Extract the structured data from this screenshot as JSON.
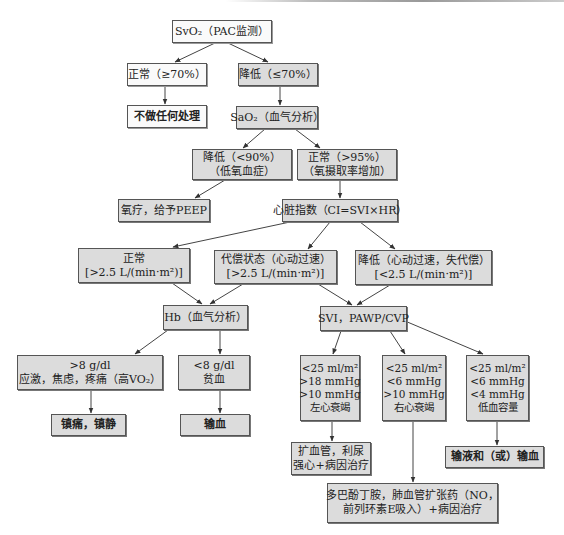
{
  "diagram": {
    "type": "flowchart",
    "nodes": {
      "svo2": {
        "lines": [
          "SvO₂（PAC监测）"
        ],
        "fill": "white"
      },
      "svo2_normal": {
        "lines": [
          "正常（≥70%）"
        ],
        "fill": "white"
      },
      "svo2_low": {
        "lines": [
          "降低（≤70%）"
        ],
        "fill": "gray"
      },
      "no_treatment": {
        "lines": [
          "不做任何处理"
        ],
        "fill": "white",
        "bold": true
      },
      "sao2": {
        "lines": [
          "SaO₂（血气分析）"
        ],
        "fill": "gray"
      },
      "sao2_low": {
        "lines": [
          "降低（<90%）",
          "（低氧血症）"
        ],
        "fill": "gray"
      },
      "sao2_normal": {
        "lines": [
          "正常（>95%）",
          "（氧摄取率增加）"
        ],
        "fill": "gray"
      },
      "oxygen_therapy": {
        "lines": [
          "氧疗，给予PEEP"
        ],
        "fill": "gray"
      },
      "cardiac_index": {
        "lines": [
          "心脏指数（CI=SVI×HR）"
        ],
        "fill": "gray"
      },
      "ci_normal": {
        "lines": [
          "正常",
          "[>2.5 L/(min·m²)]"
        ],
        "fill": "gray"
      },
      "ci_compensated": {
        "lines": [
          "代偿状态（心动过速）",
          "[>2.5 L/(min·m²)]"
        ],
        "fill": "gray"
      },
      "ci_low": {
        "lines": [
          "降低（心动过速，失代偿）",
          "[<2.5 L/(min·m²)]"
        ],
        "fill": "gray"
      },
      "hb": {
        "lines": [
          "Hb（血气分析）"
        ],
        "fill": "gray"
      },
      "svi": {
        "lines": [
          "SVI，PAWP/CVP"
        ],
        "fill": "gray"
      },
      "hb_high": {
        "lines": [
          ">8 g/dl",
          "应激，焦虑，疼痛（高VO₂）"
        ],
        "fill": "gray"
      },
      "hb_low": {
        "lines": [
          "<8 g/dl",
          "贫血"
        ],
        "fill": "gray"
      },
      "analgesia": {
        "lines": [
          "镇痛，镇静"
        ],
        "fill": "gray",
        "bold": true
      },
      "transfusion": {
        "lines": [
          "输血"
        ],
        "fill": "gray",
        "bold": true
      },
      "lv_failure": {
        "lines": [
          "<25 ml/m²",
          ">18 mmHg",
          ">10 mmHg",
          "左心衰竭"
        ],
        "fill": "gray"
      },
      "rv_failure": {
        "lines": [
          "<25 ml/m²",
          "<6 mmHg",
          ">10 mmHg",
          "右心衰竭"
        ],
        "fill": "gray"
      },
      "hypovolemia": {
        "lines": [
          "<25 ml/m²",
          "<6 mmHg",
          "<4 mmHg",
          "低血容量"
        ],
        "fill": "gray"
      },
      "lv_treatment": {
        "lines": [
          "扩血管，利尿",
          "强心+病因治疗"
        ],
        "fill": "gray"
      },
      "fluid_transfusion": {
        "lines": [
          "输液和（或）输血"
        ],
        "fill": "gray",
        "bold": true
      },
      "rv_treatment": {
        "lines": [
          "多巴酚丁胺，肺血管扩张药（NO，",
          "前列环素E吸入）+病因治疗"
        ],
        "fill": "gray"
      }
    },
    "edges": [
      [
        "svo2",
        "svo2_normal"
      ],
      [
        "svo2",
        "svo2_low"
      ],
      [
        "svo2_normal",
        "no_treatment"
      ],
      [
        "svo2_low",
        "sao2"
      ],
      [
        "sao2",
        "sao2_low"
      ],
      [
        "sao2",
        "sao2_normal"
      ],
      [
        "sao2_low",
        "oxygen_therapy"
      ],
      [
        "sao2_normal",
        "cardiac_index"
      ],
      [
        "cardiac_index",
        "ci_normal"
      ],
      [
        "cardiac_index",
        "ci_compensated"
      ],
      [
        "cardiac_index",
        "ci_low"
      ],
      [
        "ci_normal",
        "hb"
      ],
      [
        "ci_compensated",
        "hb"
      ],
      [
        "ci_compensated",
        "svi"
      ],
      [
        "ci_low",
        "svi"
      ],
      [
        "hb",
        "hb_high"
      ],
      [
        "hb",
        "hb_low"
      ],
      [
        "hb_high",
        "analgesia"
      ],
      [
        "hb_low",
        "transfusion"
      ],
      [
        "svi",
        "lv_failure"
      ],
      [
        "svi",
        "rv_failure"
      ],
      [
        "svi",
        "hypovolemia"
      ],
      [
        "lv_failure",
        "lv_treatment"
      ],
      [
        "rv_failure",
        "rv_treatment"
      ],
      [
        "hypovolemia",
        "fluid_transfusion"
      ]
    ]
  }
}
